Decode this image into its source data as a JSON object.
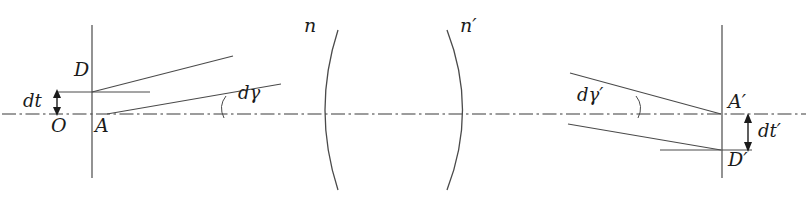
{
  "figure": {
    "background_color": "#ffffff",
    "ink_color": "#1b1b1b",
    "width": 808,
    "height": 204
  },
  "labels": {
    "object_point_D": "D",
    "origin_O": "O",
    "axis_point_A": "A",
    "object_height_dt": "dt",
    "angle_dgamma": "dγ",
    "index_n": "n",
    "index_n_prime": "n′",
    "angle_dgamma_prime": "dγ′",
    "image_axis_point_A_prime": "A′",
    "image_point_D_prime": "D′",
    "image_height_dt_prime": "dt′"
  },
  "geometry": {
    "optical_axis": {
      "y": 114,
      "x1": 2,
      "x2": 806,
      "style": "dash-dot"
    },
    "left_vertical_plane": {
      "x": 92,
      "y1": 25,
      "y2": 178
    },
    "right_vertical_plane": {
      "x": 722,
      "y1": 25,
      "y2": 178
    },
    "left_lens_surface": {
      "vertex_x": 325,
      "edge_x": 338,
      "top_y": 30,
      "bottom_y": 190,
      "bulge": "left"
    },
    "right_lens_surface": {
      "vertex_x": 465,
      "edge_x": 447,
      "top_y": 30,
      "bottom_y": 190,
      "bulge": "right"
    },
    "object_marker": {
      "x": 57,
      "y_top": 92,
      "y_bottom": 114
    },
    "image_marker": {
      "x": 748,
      "y_top": 114,
      "y_bottom": 150
    },
    "left_upper_ray": {
      "x1": 92,
      "y1": 92,
      "x2": 233,
      "y2": 56
    },
    "left_lower_ray": {
      "x1": 107,
      "y1": 114,
      "x2": 281,
      "y2": 84
    },
    "right_upper_ray": {
      "x1": 570,
      "y1": 73,
      "x2": 721,
      "y2": 114
    },
    "right_lower_ray": {
      "x1": 568,
      "y1": 124,
      "x2": 721,
      "y2": 150
    },
    "left_angle_arc_x": 226,
    "right_angle_arc_x": 636
  }
}
